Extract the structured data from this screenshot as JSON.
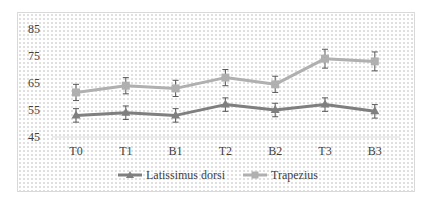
{
  "chart_data": {
    "type": "line",
    "title": "",
    "xlabel": "",
    "ylabel": "",
    "categories": [
      "T0",
      "T1",
      "B1",
      "T2",
      "B2",
      "T3",
      "B3"
    ],
    "ylim": [
      45,
      85
    ],
    "yticks": [
      45,
      55,
      65,
      75,
      85
    ],
    "grid": false,
    "legend_position": "bottom",
    "series": [
      {
        "name": "Latissimus dorsi",
        "color": "#7f7f7f",
        "marker": "triangle",
        "values": [
          53,
          54,
          53,
          57,
          55,
          57,
          54.5
        ],
        "error": [
          2.5,
          2.5,
          2.5,
          2.5,
          2.5,
          2.5,
          2.5
        ]
      },
      {
        "name": "Trapezius",
        "color": "#b0b0b0",
        "marker": "square",
        "values": [
          61.5,
          64,
          63,
          67,
          64.5,
          74,
          73
        ],
        "error": [
          3,
          3,
          3,
          3,
          3,
          3.5,
          3.5
        ]
      }
    ]
  },
  "legend": {
    "items": [
      "Latissimus dorsi",
      "Trapezius"
    ]
  }
}
